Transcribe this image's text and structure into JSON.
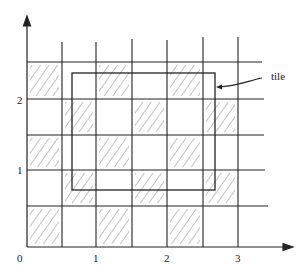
{
  "diagram": {
    "colors": {
      "ink": "#222222",
      "hatch": "#777777",
      "background": "#ffffff"
    },
    "axes": {
      "x_labels": [
        "0",
        "1",
        "2",
        "3"
      ],
      "y_labels": [
        "1",
        "2"
      ]
    },
    "annotation": {
      "label": "tile"
    },
    "grid": {
      "rows": 5,
      "cols": 7,
      "shaded_cells": [
        [
          0,
          0
        ],
        [
          0,
          2
        ],
        [
          0,
          4
        ],
        [
          1,
          1
        ],
        [
          1,
          3
        ],
        [
          1,
          5
        ],
        [
          2,
          0
        ],
        [
          2,
          2
        ],
        [
          2,
          4
        ],
        [
          3,
          1
        ],
        [
          3,
          3
        ],
        [
          3,
          5
        ],
        [
          4,
          0
        ],
        [
          4,
          2
        ],
        [
          4,
          4
        ]
      ]
    }
  }
}
